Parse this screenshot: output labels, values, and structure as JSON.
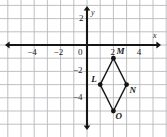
{
  "figure": {
    "background_color": "#ffffff",
    "grid_color": "#b9b9bd",
    "axis_color": "#161616",
    "point_color": "#141414",
    "segment_color": "#141414"
  },
  "axes": {
    "x_name": "x",
    "y_name": "y",
    "origin_label": "0",
    "x_ticks": [
      {
        "value": -4,
        "label": "−4"
      },
      {
        "value": -2,
        "label": "−2"
      },
      {
        "value": 2,
        "label": "2"
      },
      {
        "value": 4,
        "label": "4"
      }
    ],
    "y_ticks": [
      {
        "value": 2,
        "label": "2"
      },
      {
        "value": -2,
        "label": "−2"
      },
      {
        "value": -4,
        "label": "−4"
      }
    ],
    "x_range": [
      -6.6,
      6.1
    ],
    "y_range": [
      -7.0,
      3.4
    ],
    "grid_step": 1,
    "grid_visible": true
  },
  "chart_data": {
    "type": "scatter",
    "xlabel": "x",
    "ylabel": "y",
    "xlim": [
      -6.6,
      6.1
    ],
    "ylim": [
      -7.0,
      3.4
    ],
    "grid": true,
    "points": [
      {
        "name": "L",
        "x": 1,
        "y": -3,
        "label_dx": -9,
        "label_dy": -10
      },
      {
        "name": "M",
        "x": 2,
        "y": -1,
        "label_dx": 3,
        "label_dy": -11
      },
      {
        "name": "N",
        "x": 3,
        "y": -3,
        "label_dx": 3,
        "label_dy": 1
      },
      {
        "name": "O",
        "x": 2,
        "y": -5,
        "label_dx": 2,
        "label_dy": 1
      }
    ],
    "segments": [
      {
        "from": "L",
        "to": "M"
      },
      {
        "from": "M",
        "to": "N"
      },
      {
        "from": "N",
        "to": "O"
      },
      {
        "from": "O",
        "to": "L"
      }
    ]
  }
}
